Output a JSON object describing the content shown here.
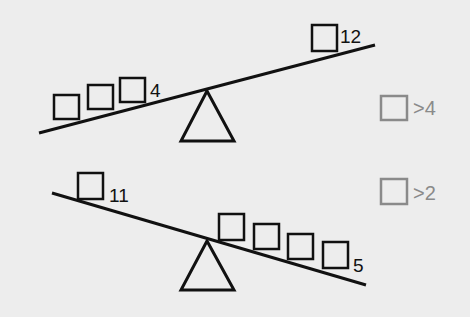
{
  "diagram": {
    "type": "balance-scale-puzzle",
    "scales": [
      {
        "id": "top",
        "tilt": "right side up",
        "left_side": {
          "box_count": 3,
          "label": "4"
        },
        "right_side": {
          "box_count": 1,
          "label": "12"
        },
        "answer_hint": {
          "text": ">4"
        }
      },
      {
        "id": "bottom",
        "tilt": "right side down",
        "left_side": {
          "box_count": 1,
          "label": "11"
        },
        "right_side": {
          "box_count": 4,
          "label": "5"
        },
        "answer_hint": {
          "text": ">2"
        }
      }
    ],
    "colors": {
      "background": "#ededed",
      "ink": "#111111",
      "hint": "#8a8a8a"
    }
  }
}
